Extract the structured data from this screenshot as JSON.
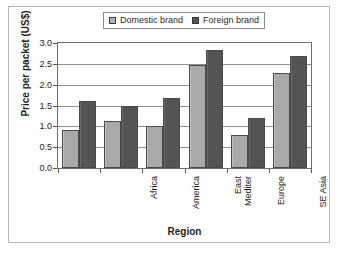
{
  "chart_data": {
    "type": "bar",
    "title": "",
    "xlabel": "Region",
    "ylabel": "Price per packet (US$)",
    "ylim": [
      0.0,
      3.0
    ],
    "ytick_values": [
      0.0,
      0.5,
      1.0,
      1.5,
      2.0,
      2.5,
      3.0
    ],
    "ytick_labels": [
      "0.0",
      "0.5",
      "1.0",
      "1.5",
      "2.0",
      "2.5",
      "3.0"
    ],
    "grid": true,
    "legend_position": "top-center",
    "categories": [
      "Africa",
      "America",
      "East\nMediter",
      "Europe",
      "SE Asia",
      "Western\nPacific"
    ],
    "series": [
      {
        "name": "Domestic brand",
        "color": "#aeaeae",
        "values": [
          0.92,
          1.12,
          1.02,
          2.47,
          0.8,
          2.27
        ]
      },
      {
        "name": "Foreign brand",
        "color": "#585858",
        "values": [
          1.62,
          1.48,
          1.67,
          2.83,
          1.2,
          2.7
        ]
      }
    ]
  },
  "legend": {
    "items": [
      {
        "label": "Domestic brand",
        "swatch": "domestic"
      },
      {
        "label": "Foreign brand",
        "swatch": "foreign"
      }
    ]
  }
}
